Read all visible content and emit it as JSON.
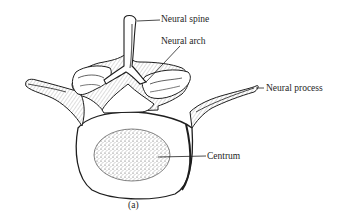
{
  "figure": {
    "caption": "(a)",
    "labels": [
      {
        "id": "neural-spine",
        "text": "Neural spine"
      },
      {
        "id": "neural-arch",
        "text": "Neural arch"
      },
      {
        "id": "neural-process",
        "text": "Neural process"
      },
      {
        "id": "centrum",
        "text": "Centrum"
      }
    ],
    "colors": {
      "ink": "#1e1e1e",
      "background": "#ffffff",
      "stipple": "#555555"
    }
  }
}
